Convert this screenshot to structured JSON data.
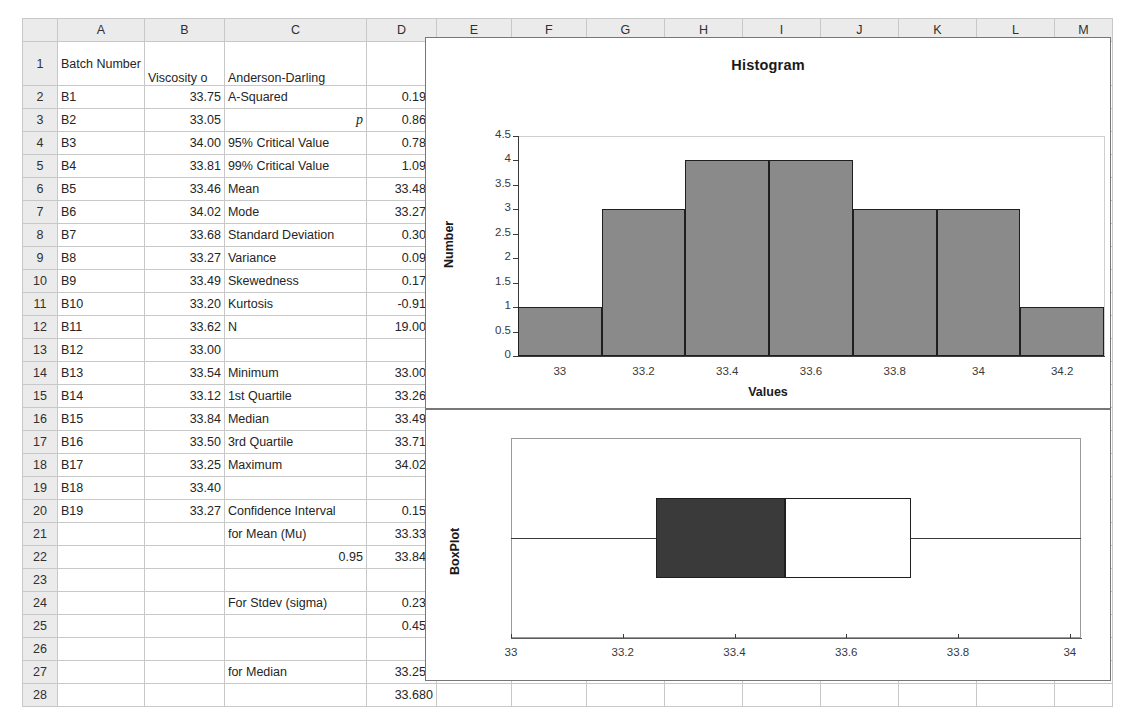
{
  "spreadsheet": {
    "column_headers": [
      "A",
      "B",
      "C",
      "D",
      "E",
      "F",
      "G",
      "H",
      "I",
      "J",
      "K",
      "L",
      "M"
    ],
    "row_numbers": [
      "1",
      "2",
      "3",
      "4",
      "5",
      "6",
      "7",
      "8",
      "9",
      "10",
      "11",
      "12",
      "13",
      "14",
      "15",
      "16",
      "17",
      "18",
      "19",
      "20",
      "21",
      "22",
      "23",
      "24",
      "25",
      "26",
      "27",
      "28"
    ],
    "header_row": {
      "a": "Batch Number",
      "b": "Viscosity o",
      "c": "Anderson-Darling",
      "d": ""
    },
    "rows": [
      {
        "n": "2",
        "a": "B1",
        "b": "33.75",
        "c": "A-Squared",
        "d": "0.198"
      },
      {
        "n": "3",
        "a": "B2",
        "b": "33.05",
        "c": "p",
        "d": "0.869",
        "c_italic": true,
        "c_align": "right"
      },
      {
        "n": "4",
        "a": "B3",
        "b": "34.00",
        "c": "95% Critical Value",
        "d": "0.787"
      },
      {
        "n": "5",
        "a": "B4",
        "b": "33.81",
        "c": "99% Critical Value",
        "d": "1.092"
      },
      {
        "n": "6",
        "a": "B5",
        "b": "33.46",
        "c": "Mean",
        "d": "33.488"
      },
      {
        "n": "7",
        "a": "B6",
        "b": "34.02",
        "c": "Mode",
        "d": "33.270"
      },
      {
        "n": "8",
        "a": "B7",
        "b": "33.68",
        "c": "Standard Deviation",
        "d": "0.308"
      },
      {
        "n": "9",
        "a": "B8",
        "b": "33.27",
        "c": "Variance",
        "d": "0.095"
      },
      {
        "n": "10",
        "a": "B9",
        "b": "33.49",
        "c": "Skewedness",
        "d": "0.172"
      },
      {
        "n": "11",
        "a": "B10",
        "b": "33.20",
        "c": "Kurtosis",
        "d": "-0.917"
      },
      {
        "n": "12",
        "a": "B11",
        "b": "33.62",
        "c": "N",
        "d": "19.000"
      },
      {
        "n": "13",
        "a": "B12",
        "b": "33.00",
        "c": "",
        "d": ""
      },
      {
        "n": "14",
        "a": "B13",
        "b": "33.54",
        "c": "Minimum",
        "d": "33.000"
      },
      {
        "n": "15",
        "a": "B14",
        "b": "33.12",
        "c": "1st Quartile",
        "d": "33.260"
      },
      {
        "n": "16",
        "a": "B15",
        "b": "33.84",
        "c": "Median",
        "d": "33.490"
      },
      {
        "n": "17",
        "a": "B16",
        "b": "33.50",
        "c": "3rd Quartile",
        "d": "33.715"
      },
      {
        "n": "18",
        "a": "B17",
        "b": "33.25",
        "c": "Maximum",
        "d": "34.020"
      },
      {
        "n": "19",
        "a": "B18",
        "b": "33.40",
        "c": "",
        "d": ""
      },
      {
        "n": "20",
        "a": "B19",
        "b": "33.27",
        "c": "Confidence Interval",
        "d": "0.158"
      },
      {
        "n": "21",
        "a": "",
        "b": "",
        "c": "for Mean (Mu)",
        "d": "33.330"
      },
      {
        "n": "22",
        "a": "",
        "b": "",
        "c": "0.95",
        "d": "33.846",
        "c_align": "right"
      },
      {
        "n": "23",
        "a": "",
        "b": "",
        "c": "",
        "d": ""
      },
      {
        "n": "24",
        "a": "",
        "b": "",
        "c": "For Stdev (sigma)",
        "d": "0.233"
      },
      {
        "n": "25",
        "a": "",
        "b": "",
        "c": "",
        "d": "0.455"
      },
      {
        "n": "26",
        "a": "",
        "b": "",
        "c": "",
        "d": ""
      },
      {
        "n": "27",
        "a": "",
        "b": "",
        "c": "for Median",
        "d": "33.250"
      },
      {
        "n": "28",
        "a": "",
        "b": "",
        "c": "",
        "d": "33.680"
      }
    ]
  },
  "chart_data": [
    {
      "type": "bar",
      "name": "histogram",
      "title": "Histogram",
      "xlabel": "Values",
      "ylabel": "Number",
      "categories": [
        "33",
        "33.2",
        "33.4",
        "33.6",
        "33.8",
        "34",
        "34.2"
      ],
      "values": [
        1,
        3,
        4,
        4,
        3,
        3,
        1
      ],
      "ylim": [
        0,
        4.5
      ],
      "yticks": [
        "0",
        "0.5",
        "1",
        "1.5",
        "2",
        "2.5",
        "3",
        "3.5",
        "4",
        "4.5"
      ],
      "ytick_values": [
        0,
        0.5,
        1,
        1.5,
        2,
        2.5,
        3,
        3.5,
        4,
        4.5
      ],
      "grid": false,
      "legend": "none",
      "bar_color": "#8a8a8a",
      "bar_edge_color": "#1f1f1f"
    },
    {
      "type": "boxplot",
      "name": "boxplot",
      "title": "",
      "ylabel": "BoxPlot",
      "xticks": [
        "33",
        "33.2",
        "33.4",
        "33.6",
        "33.8",
        "34"
      ],
      "xtick_values": [
        33,
        33.2,
        33.4,
        33.6,
        33.8,
        34
      ],
      "xlim": [
        33.0,
        34.02
      ],
      "minimum": 33.0,
      "q1": 33.26,
      "median": 33.49,
      "q3": 33.715,
      "maximum": 34.02,
      "box_lower_color": "#3a3a3a",
      "box_upper_color": "#ffffff",
      "grid": false,
      "legend": "none"
    }
  ]
}
